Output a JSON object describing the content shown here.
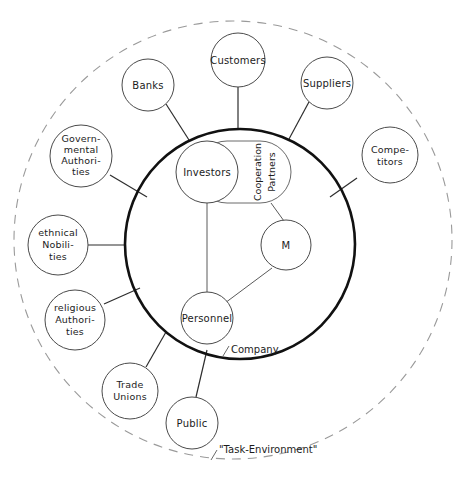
{
  "diagram": {
    "boundaries": {
      "inner": {
        "label": "Company",
        "style": "solid-bold",
        "color": "#111111"
      },
      "outer": {
        "label": "\"Task-Environment\"",
        "style": "dashed",
        "color": "#9a9a9a"
      }
    },
    "internal_nodes": [
      {
        "id": "investors",
        "label": "Investors",
        "shape": "circle"
      },
      {
        "id": "cooperation-partners",
        "label_line1": "Cooperation",
        "label_line2": "Partners",
        "shape": "stadium",
        "orientation": "vertical"
      },
      {
        "id": "management",
        "label": "M",
        "shape": "circle"
      },
      {
        "id": "personnel",
        "label": "Personnel",
        "shape": "circle"
      }
    ],
    "external_nodes": [
      {
        "id": "customers",
        "lines": [
          "Customers"
        ]
      },
      {
        "id": "banks",
        "lines": [
          "Banks"
        ]
      },
      {
        "id": "suppliers",
        "lines": [
          "Suppliers"
        ]
      },
      {
        "id": "governmental-authorities",
        "lines": [
          "Govern-",
          "mental",
          "Authori-",
          "ties"
        ]
      },
      {
        "id": "competitors",
        "lines": [
          "Compe-",
          "titors"
        ]
      },
      {
        "id": "ethnical-nobilities",
        "lines": [
          "ethnical",
          "Nobili-",
          "ties"
        ]
      },
      {
        "id": "religious-authorities",
        "lines": [
          "religious",
          "Authori-",
          "ties"
        ]
      },
      {
        "id": "trade-unions",
        "lines": [
          "Trade",
          "Unions"
        ]
      },
      {
        "id": "public",
        "lines": [
          "Public"
        ]
      }
    ]
  }
}
